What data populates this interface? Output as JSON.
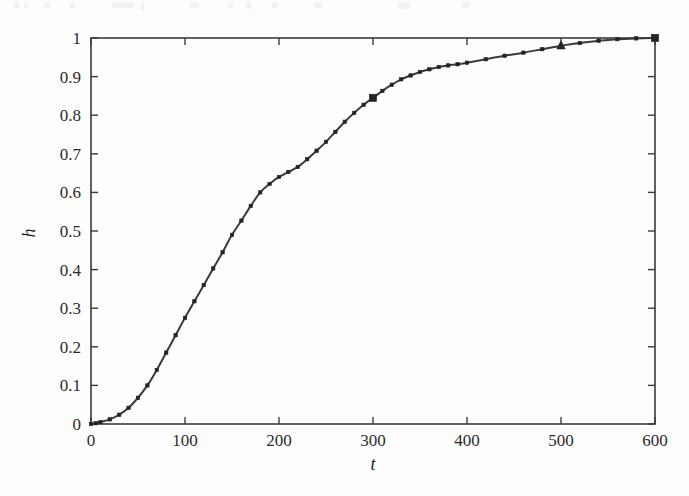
{
  "figure": {
    "background_color": "#fdfdfd",
    "ink_color": "#3a3a3a",
    "marker_color": "#242424"
  },
  "chart_data": {
    "type": "line",
    "title": "",
    "subtitle": "",
    "xlabel": "t",
    "ylabel": "h",
    "xlim": [
      0,
      600
    ],
    "ylim": [
      0,
      1
    ],
    "grid": false,
    "legend": null,
    "legend_position": "none",
    "xticks": [
      0,
      100,
      200,
      300,
      400,
      500,
      600
    ],
    "xtick_labels": [
      "0",
      "100",
      "200",
      "300",
      "400",
      "500",
      "600"
    ],
    "yticks": [
      0,
      0.1,
      0.2,
      0.3,
      0.4,
      0.5,
      0.6,
      0.7,
      0.8,
      0.9,
      1
    ],
    "ytick_labels": [
      "0",
      "0.1",
      "0.2",
      "0.3",
      "0.4",
      "0.5",
      "0.6",
      "0.7",
      "0.8",
      "0.9",
      "1"
    ],
    "series": [
      {
        "name": "h(t)",
        "marker": "square",
        "line_style": "solid",
        "x": [
          0,
          5,
          10,
          20,
          30,
          40,
          50,
          60,
          70,
          80,
          90,
          100,
          110,
          120,
          130,
          140,
          150,
          160,
          170,
          180,
          190,
          200,
          210,
          220,
          230,
          240,
          250,
          260,
          270,
          280,
          290,
          300,
          310,
          320,
          330,
          340,
          350,
          360,
          370,
          380,
          390,
          400,
          420,
          440,
          460,
          480,
          500,
          520,
          540,
          560,
          580,
          600
        ],
        "y": [
          0.0,
          0.002,
          0.005,
          0.012,
          0.024,
          0.042,
          0.068,
          0.1,
          0.14,
          0.185,
          0.23,
          0.275,
          0.318,
          0.36,
          0.403,
          0.445,
          0.49,
          0.527,
          0.565,
          0.6,
          0.622,
          0.64,
          0.653,
          0.666,
          0.686,
          0.708,
          0.731,
          0.757,
          0.783,
          0.806,
          0.827,
          0.845,
          0.863,
          0.879,
          0.893,
          0.903,
          0.912,
          0.919,
          0.925,
          0.929,
          0.932,
          0.936,
          0.945,
          0.954,
          0.962,
          0.971,
          0.98,
          0.987,
          0.993,
          0.997,
          0.999,
          1.0
        ]
      }
    ],
    "highlight_markers": [
      {
        "x": 300,
        "y": 0.845,
        "shape": "square"
      },
      {
        "x": 500,
        "y": 0.98,
        "shape": "triangle"
      },
      {
        "x": 600,
        "y": 1.0,
        "shape": "square"
      }
    ],
    "annotations": []
  }
}
